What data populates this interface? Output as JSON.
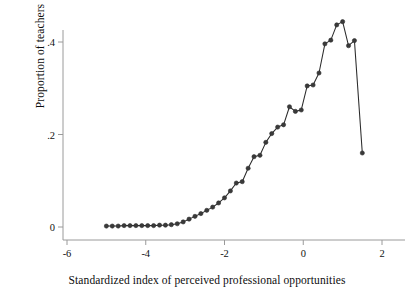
{
  "chart_data": {
    "type": "line",
    "title": "",
    "subtitle": "",
    "xlabel": "Standardized index of perceived professional opportunities",
    "ylabel": "Proportion of teachers",
    "xlim": [
      -6.4,
      2.3
    ],
    "ylim": [
      -0.015,
      0.48
    ],
    "xticks": [
      -6,
      -4,
      -2,
      0,
      2
    ],
    "xticklabels": [
      "-6",
      "-4",
      "-2",
      "0",
      "2"
    ],
    "yticks": [
      0,
      0.2,
      0.4
    ],
    "yticklabels": [
      "0",
      ".2",
      ".4"
    ],
    "grid": false,
    "legend": null,
    "marker": "circle",
    "marker_size": 3,
    "line_color": "#2b2b2b",
    "marker_fill": "#3a3a3a",
    "axis_color": "#9a9a9a",
    "series": [
      {
        "name": "Proportion of teachers",
        "x": [
          -5.0,
          -4.85,
          -4.7,
          -4.55,
          -4.4,
          -4.25,
          -4.1,
          -3.95,
          -3.8,
          -3.65,
          -3.5,
          -3.35,
          -3.2,
          -3.05,
          -2.9,
          -2.75,
          -2.6,
          -2.45,
          -2.3,
          -2.15,
          -2.0,
          -1.85,
          -1.7,
          -1.55,
          -1.4,
          -1.25,
          -1.1,
          -0.95,
          -0.8,
          -0.65,
          -0.5,
          -0.35,
          -0.2,
          -0.05,
          0.1,
          0.25,
          0.4,
          0.55,
          0.7,
          0.85,
          1.0,
          1.15,
          1.3,
          1.5
        ],
        "y": [
          0.002,
          0.002,
          0.002,
          0.003,
          0.003,
          0.003,
          0.003,
          0.003,
          0.003,
          0.004,
          0.004,
          0.005,
          0.007,
          0.011,
          0.017,
          0.023,
          0.029,
          0.036,
          0.043,
          0.052,
          0.063,
          0.078,
          0.095,
          0.098,
          0.127,
          0.152,
          0.155,
          0.183,
          0.202,
          0.216,
          0.221,
          0.26,
          0.25,
          0.253,
          0.305,
          0.307,
          0.333,
          0.396,
          0.404,
          0.437,
          0.444,
          0.392,
          0.403,
          0.16
        ]
      }
    ]
  },
  "figure": {
    "background": "#ffffff",
    "axis_line_color": "#9a9a9a"
  }
}
